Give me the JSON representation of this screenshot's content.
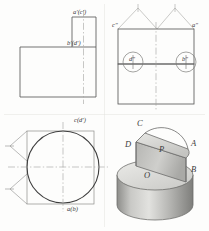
{
  "drawing": {
    "title": "Orthographic projection with isometric pictorial",
    "sheet": {
      "width": 209,
      "height": 231,
      "background": "#fdfdfc"
    },
    "style": {
      "line_color": "#4a4a4a",
      "thin_line_color": "#8e8e8e",
      "center_line_color": "#9a9a9a",
      "label_color": "#3a3a3a",
      "shade_light": "#d9d9d6",
      "shade_mid": "#b9b9b6",
      "shade_dark": "#8f8f8c"
    },
    "views": {
      "front": {
        "name": "front-view",
        "shape": "L-shaped profile",
        "labels": [
          {
            "id": "a-prime-c-prime",
            "text": "a'(c')",
            "x": 73,
            "y": 13
          },
          {
            "id": "b-prime-d-prime",
            "text": "b'(d')",
            "x": 67,
            "y": 44
          }
        ]
      },
      "side": {
        "name": "side-view",
        "shape": "rectangle with hatched roof and two detail circles",
        "labels": [
          {
            "id": "c-double-prime",
            "text": "c″",
            "x": 113,
            "y": 26
          },
          {
            "id": "a-double-prime",
            "text": "a″",
            "x": 193,
            "y": 26
          },
          {
            "id": "d-double-prime",
            "text": "d″",
            "x": 134,
            "y": 58
          },
          {
            "id": "b-double-prime",
            "text": "b″",
            "x": 185,
            "y": 58
          }
        ]
      },
      "top": {
        "name": "top-view",
        "shape": "circle with inscribed rectangle and arrow marks",
        "labels": [
          {
            "id": "c-d",
            "text": "c(d')",
            "x": 74,
            "y": 120
          },
          {
            "id": "a-b",
            "text": "a(b)",
            "x": 67,
            "y": 209
          }
        ]
      },
      "pictorial": {
        "name": "isometric-view",
        "shape": "cylinder with vertical half-disc plate",
        "labels": [
          {
            "id": "point-C",
            "text": "C",
            "x": 139,
            "y": 124,
            "size": "lg"
          },
          {
            "id": "point-A",
            "text": "A",
            "x": 192,
            "y": 144,
            "size": "lg"
          },
          {
            "id": "point-D",
            "text": "D",
            "x": 127,
            "y": 145,
            "size": "lg"
          },
          {
            "id": "plane-P",
            "text": "P",
            "x": 161,
            "y": 150,
            "size": "lg"
          },
          {
            "id": "point-B",
            "text": "B",
            "x": 192,
            "y": 170,
            "size": "lg"
          },
          {
            "id": "center-O",
            "text": "O",
            "x": 146,
            "y": 176,
            "size": "lg"
          }
        ]
      }
    }
  }
}
